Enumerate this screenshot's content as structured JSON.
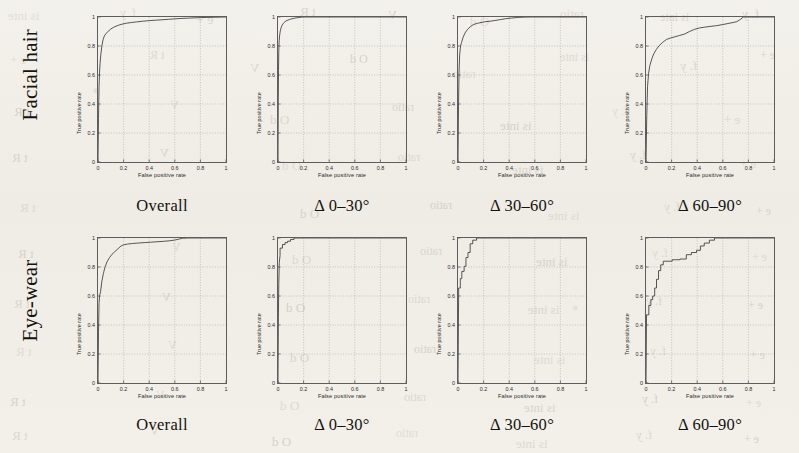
{
  "figure": {
    "background_color": "#f1efe9",
    "ink_color": "#3a3a3a",
    "rows": [
      {
        "label": "Facial hair"
      },
      {
        "label": "Eye-wear"
      }
    ],
    "column_captions": [
      "Overall",
      "Δ 0–30°",
      "Δ 30–60°",
      "Δ 60–90°"
    ],
    "bleed_through_text": [
      "is inte",
      "f. y",
      "e +",
      "t R",
      "V",
      "O d",
      "ratio"
    ]
  },
  "axes": {
    "xlabel": "False positive rate",
    "ylabel": "True positive rate",
    "xticks": [
      "0",
      "0.2",
      "0.4",
      "0.6",
      "0.8",
      "1"
    ],
    "yticks": [
      "0",
      "0.2",
      "0.4",
      "0.6",
      "0.8",
      "1"
    ],
    "xlim": [
      0,
      1
    ],
    "ylim": [
      0,
      1
    ],
    "grid": true
  },
  "chart_data": [
    {
      "type": "line",
      "title": "Facial hair — Overall",
      "row": "Facial hair",
      "column": "Overall",
      "xlabel": "False positive rate",
      "ylabel": "True positive rate",
      "xlim": [
        0,
        1
      ],
      "ylim": [
        0,
        1
      ],
      "grid": true,
      "series": [
        {
          "name": "ROC",
          "x": [
            0,
            0.004,
            0.008,
            0.012,
            0.016,
            0.022,
            0.03,
            0.04,
            0.05,
            0.065,
            0.08,
            0.1,
            0.12,
            0.15,
            0.18,
            0.22,
            0.26,
            0.3,
            0.35,
            0.4,
            0.45,
            0.5,
            0.55,
            0.6,
            0.65,
            0.7,
            0.75,
            0.8,
            0.85,
            0.9,
            0.95,
            1.0
          ],
          "y": [
            0,
            0.3,
            0.52,
            0.62,
            0.68,
            0.74,
            0.8,
            0.845,
            0.87,
            0.888,
            0.902,
            0.917,
            0.928,
            0.94,
            0.949,
            0.957,
            0.962,
            0.966,
            0.971,
            0.975,
            0.978,
            0.981,
            0.984,
            0.987,
            0.99,
            0.992,
            0.994,
            0.996,
            0.997,
            0.998,
            0.999,
            1.0
          ]
        }
      ]
    },
    {
      "type": "line",
      "title": "Facial hair — Δ 0–30°",
      "row": "Facial hair",
      "column": "Δ 0–30°",
      "xlabel": "False positive rate",
      "ylabel": "True positive rate",
      "xlim": [
        0,
        1
      ],
      "ylim": [
        0,
        1
      ],
      "grid": true,
      "series": [
        {
          "name": "ROC",
          "x": [
            0,
            0.002,
            0.004,
            0.006,
            0.009,
            0.013,
            0.018,
            0.024,
            0.032,
            0.042,
            0.055,
            0.07,
            0.09,
            0.11,
            0.13,
            0.15,
            0.17,
            0.185,
            0.2,
            1.0
          ],
          "y": [
            0,
            0.4,
            0.63,
            0.76,
            0.835,
            0.875,
            0.905,
            0.925,
            0.943,
            0.957,
            0.968,
            0.976,
            0.983,
            0.988,
            0.992,
            0.995,
            0.997,
            0.999,
            1.0,
            1.0
          ]
        }
      ]
    },
    {
      "type": "line",
      "title": "Facial hair — Δ 30–60°",
      "row": "Facial hair",
      "column": "Δ 30–60°",
      "xlabel": "False positive rate",
      "ylabel": "True positive rate",
      "xlim": [
        0,
        1
      ],
      "ylim": [
        0,
        1
      ],
      "grid": true,
      "series": [
        {
          "name": "ROC",
          "x": [
            0,
            0.004,
            0.008,
            0.013,
            0.02,
            0.028,
            0.04,
            0.055,
            0.075,
            0.095,
            0.12,
            0.15,
            0.18,
            0.21,
            0.25,
            0.29,
            0.33,
            0.37,
            0.42,
            0.47,
            0.52,
            0.58,
            0.64,
            0.7,
            0.78,
            0.86,
            0.93,
            1.0
          ],
          "y": [
            0,
            0.38,
            0.62,
            0.74,
            0.8,
            0.825,
            0.86,
            0.89,
            0.915,
            0.932,
            0.948,
            0.956,
            0.962,
            0.967,
            0.971,
            0.976,
            0.982,
            0.988,
            0.993,
            0.997,
            0.999,
            1.0,
            1.0,
            1.0,
            1.0,
            1.0,
            1.0,
            1.0
          ]
        }
      ]
    },
    {
      "type": "line",
      "title": "Facial hair — Δ 60–90°",
      "row": "Facial hair",
      "column": "Δ 60–90°",
      "xlabel": "False positive rate",
      "ylabel": "True positive rate",
      "xlim": [
        0,
        1
      ],
      "ylim": [
        0,
        1
      ],
      "grid": true,
      "series": [
        {
          "name": "ROC",
          "x": [
            0,
            0.006,
            0.012,
            0.02,
            0.03,
            0.045,
            0.06,
            0.08,
            0.1,
            0.13,
            0.16,
            0.19,
            0.22,
            0.26,
            0.3,
            0.34,
            0.38,
            0.42,
            0.46,
            0.5,
            0.55,
            0.6,
            0.64,
            0.68,
            0.71,
            0.74,
            0.76,
            0.8,
            0.88,
            1.0
          ],
          "y": [
            0,
            0.32,
            0.52,
            0.61,
            0.665,
            0.71,
            0.745,
            0.775,
            0.8,
            0.825,
            0.845,
            0.855,
            0.862,
            0.872,
            0.882,
            0.9,
            0.915,
            0.925,
            0.93,
            0.935,
            0.94,
            0.948,
            0.955,
            0.962,
            0.968,
            0.985,
            1.0,
            1.0,
            1.0,
            1.0
          ]
        }
      ]
    },
    {
      "type": "line",
      "title": "Eye-wear — Overall",
      "row": "Eye-wear",
      "column": "Overall",
      "xlabel": "False positive rate",
      "ylabel": "True positive rate",
      "xlim": [
        0,
        1
      ],
      "ylim": [
        0,
        1
      ],
      "grid": true,
      "series": [
        {
          "name": "ROC",
          "x": [
            0,
            0.004,
            0.008,
            0.013,
            0.02,
            0.03,
            0.042,
            0.055,
            0.07,
            0.09,
            0.11,
            0.13,
            0.155,
            0.18,
            0.2,
            0.23,
            0.27,
            0.31,
            0.36,
            0.41,
            0.46,
            0.51,
            0.56,
            0.6,
            0.63,
            0.66,
            0.7,
            0.78,
            0.88,
            1.0
          ],
          "y": [
            0,
            0.35,
            0.55,
            0.605,
            0.63,
            0.7,
            0.755,
            0.8,
            0.835,
            0.865,
            0.888,
            0.905,
            0.925,
            0.945,
            0.953,
            0.958,
            0.962,
            0.965,
            0.968,
            0.971,
            0.974,
            0.977,
            0.981,
            0.986,
            0.992,
            0.998,
            1.0,
            1.0,
            1.0,
            1.0
          ]
        }
      ]
    },
    {
      "type": "line",
      "title": "Eye-wear — Δ 0–30°",
      "row": "Eye-wear",
      "column": "Δ 0–30°",
      "xlabel": "False positive rate",
      "ylabel": "True positive rate",
      "xlim": [
        0,
        1
      ],
      "ylim": [
        0,
        1
      ],
      "grid": true,
      "series": [
        {
          "name": "ROC",
          "x": [
            0,
            0.003,
            0.006,
            0.01,
            0.016,
            0.016,
            0.035,
            0.035,
            0.055,
            0.055,
            0.075,
            0.075,
            0.098,
            0.098,
            0.125,
            0.125,
            1.0
          ],
          "y": [
            0,
            0.45,
            0.68,
            0.83,
            0.88,
            0.93,
            0.93,
            0.955,
            0.955,
            0.968,
            0.968,
            0.978,
            0.978,
            0.99,
            0.99,
            1.0,
            1.0
          ]
        }
      ]
    },
    {
      "type": "line",
      "title": "Eye-wear — Δ 30–60°",
      "row": "Eye-wear",
      "column": "Δ 30–60°",
      "xlabel": "False positive rate",
      "ylabel": "True positive rate",
      "xlim": [
        0,
        1
      ],
      "ylim": [
        0,
        1
      ],
      "grid": true,
      "series": [
        {
          "name": "ROC",
          "x": [
            0,
            0.005,
            0.005,
            0.018,
            0.018,
            0.03,
            0.03,
            0.048,
            0.048,
            0.062,
            0.062,
            0.078,
            0.078,
            0.095,
            0.095,
            0.115,
            0.115,
            0.145,
            0.145,
            1.0
          ],
          "y": [
            0,
            0.62,
            0.655,
            0.655,
            0.72,
            0.72,
            0.77,
            0.77,
            0.805,
            0.805,
            0.865,
            0.865,
            0.9,
            0.9,
            0.96,
            0.96,
            0.985,
            0.985,
            1.0,
            1.0
          ]
        }
      ]
    },
    {
      "type": "line",
      "title": "Eye-wear — Δ 60–90°",
      "row": "Eye-wear",
      "column": "Δ 60–90°",
      "xlabel": "False positive rate",
      "ylabel": "True positive rate",
      "xlim": [
        0,
        1
      ],
      "ylim": [
        0,
        1
      ],
      "grid": true,
      "series": [
        {
          "name": "ROC",
          "x": [
            0,
            0.004,
            0.004,
            0.022,
            0.022,
            0.038,
            0.038,
            0.052,
            0.052,
            0.068,
            0.068,
            0.082,
            0.082,
            0.098,
            0.098,
            0.115,
            0.115,
            0.135,
            0.135,
            0.205,
            0.205,
            0.265,
            0.265,
            0.315,
            0.315,
            0.355,
            0.355,
            0.395,
            0.395,
            0.425,
            0.425,
            0.455,
            0.455,
            0.495,
            0.495,
            0.535,
            0.535,
            1.0
          ],
          "y": [
            0,
            0.455,
            0.47,
            0.47,
            0.535,
            0.535,
            0.575,
            0.575,
            0.6,
            0.6,
            0.655,
            0.655,
            0.715,
            0.715,
            0.775,
            0.775,
            0.815,
            0.815,
            0.84,
            0.84,
            0.85,
            0.85,
            0.855,
            0.855,
            0.885,
            0.885,
            0.9,
            0.9,
            0.915,
            0.915,
            0.945,
            0.945,
            0.965,
            0.965,
            0.985,
            0.985,
            1.0,
            1.0
          ]
        }
      ]
    }
  ]
}
